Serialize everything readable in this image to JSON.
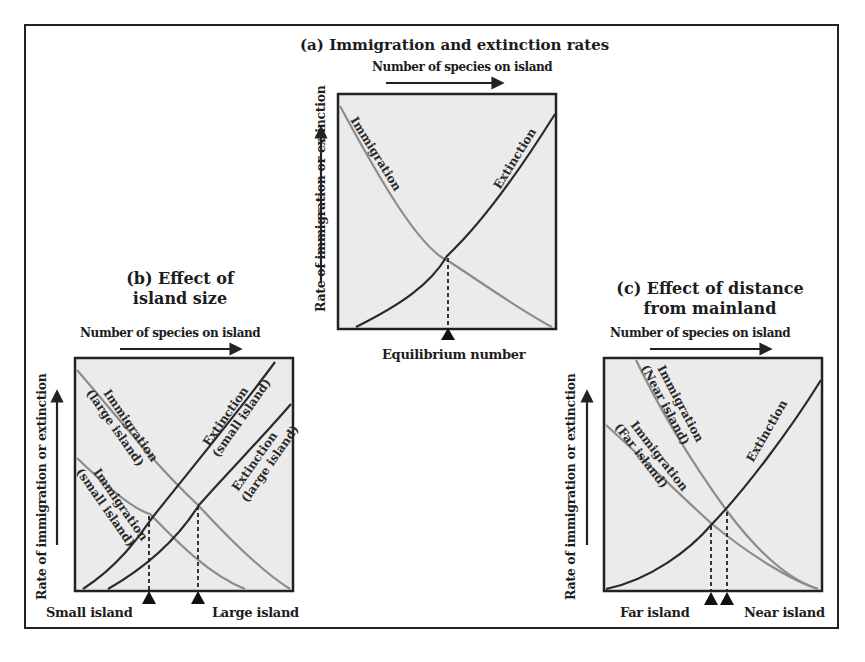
{
  "colors": {
    "panel_fill": "#ebebeb",
    "frame": "#222222",
    "extinction_curve": "#2a2a2a",
    "immigration_curve": "#8c8c8c"
  },
  "panel_a": {
    "title": "(a) Immigration and extinction rates",
    "x_axis_label": "Number of species on island",
    "y_axis_label": "Rate of immigration or extinction",
    "bottom_label": "Equilibrium number",
    "curve_labels": {
      "immigration": "Immigration",
      "extinction": "Extinction"
    }
  },
  "panel_b": {
    "title_line1": "(b) Effect of",
    "title_line2": "island size",
    "x_axis_label": "Number of species on island",
    "y_axis_label": "Rate of immigration or extinction",
    "bottom_left_label": "Small island",
    "bottom_right_label": "Large island",
    "curve_labels": {
      "immigration_large": [
        "Immigration",
        "(large island)"
      ],
      "immigration_small": [
        "Immigration",
        "(small island)"
      ],
      "extinction_small": [
        "Extinction",
        "(small island)"
      ],
      "extinction_large": [
        "Extinction",
        "(large island)"
      ]
    }
  },
  "panel_c": {
    "title_line1": "(c) Effect of distance",
    "title_line2": "from mainland",
    "x_axis_label": "Number of species on island",
    "y_axis_label": "Rate of immigration or extinction",
    "bottom_left_label": "Far island",
    "bottom_right_label": "Near island",
    "curve_labels": {
      "immigration_near": [
        "Immigration",
        "(Near island)"
      ],
      "immigration_far": [
        "Immigration",
        "(Far island)"
      ],
      "extinction": "Extinction"
    }
  }
}
